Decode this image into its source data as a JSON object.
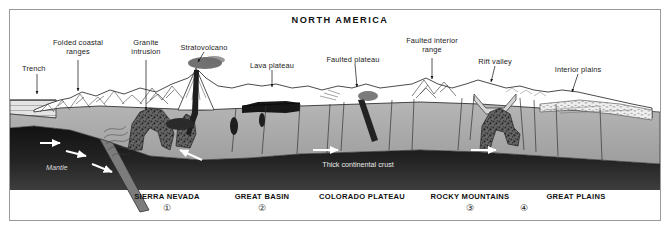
{
  "figure": {
    "title": "NORTH AMERICA",
    "frame_color": "#9a9a9a",
    "background": "#ffffff"
  },
  "callouts": [
    {
      "id": "trench",
      "text": "Trench",
      "x": 37,
      "y": 68,
      "align": "left",
      "tip_x": 37,
      "tip_y": 95
    },
    {
      "id": "folded-coastal",
      "text": "Folded coastal ranges",
      "x": 78,
      "y": 42,
      "align": "center",
      "tip_x": 78,
      "tip_y": 92
    },
    {
      "id": "granite-intrusion",
      "text": "Granite intrusion",
      "x": 146,
      "y": 42,
      "align": "center",
      "tip_x": 146,
      "tip_y": 112
    },
    {
      "id": "stratovolcano",
      "text": "Stratovolcano",
      "x": 204,
      "y": 44,
      "align": "center",
      "tip_x": 196,
      "tip_y": 70
    },
    {
      "id": "lava-plateau",
      "text": "Lava plateau",
      "x": 272,
      "y": 62,
      "align": "center",
      "tip_x": 272,
      "tip_y": 88
    },
    {
      "id": "faulted-plateau",
      "text": "Faulted plateau",
      "x": 348,
      "y": 56,
      "align": "center",
      "tip_x": 358,
      "tip_y": 88
    },
    {
      "id": "faulted-interior",
      "text": "Faulted interior range",
      "x": 432,
      "y": 40,
      "align": "center",
      "tip_x": 432,
      "tip_y": 82
    },
    {
      "id": "rift-valley",
      "text": "Rift valley",
      "x": 497,
      "y": 58,
      "align": "center",
      "tip_x": 492,
      "tip_y": 83
    },
    {
      "id": "interior-plains",
      "text": "Interior plains",
      "x": 578,
      "y": 66,
      "align": "center",
      "tip_x": 572,
      "tip_y": 93
    }
  ],
  "inner_labels": [
    {
      "id": "mantle",
      "text": "Mantle",
      "x": 46,
      "y": 168
    },
    {
      "id": "thick-crust",
      "text": "Thick continental crust",
      "x": 358,
      "y": 165
    }
  ],
  "regions": [
    {
      "id": "sierra-nevada",
      "label": "SIERRA NEVADA",
      "x": 167,
      "y": 196,
      "number": "①",
      "num_x": 167,
      "num_y": 209
    },
    {
      "id": "great-basin",
      "label": "GREAT BASIN",
      "x": 262,
      "y": 196,
      "number": "②",
      "num_x": 262,
      "num_y": 209
    },
    {
      "id": "colorado-plateau",
      "label": "COLORADO PLATEAU",
      "x": 362,
      "y": 196,
      "number": "",
      "num_x": 0,
      "num_y": 0
    },
    {
      "id": "rocky-mountains",
      "label": "ROCKY MOUNTAINS",
      "x": 470,
      "y": 196,
      "number": "③",
      "num_x": 470,
      "num_y": 209
    },
    {
      "id": "great-plains",
      "label": "GREAT PLAINS",
      "x": 576,
      "y": 196,
      "number": "",
      "num_x": 0,
      "num_y": 0
    },
    {
      "id": "unlabeled-four",
      "label": "",
      "x": 0,
      "y": 0,
      "number": "④",
      "num_x": 524,
      "num_y": 209
    }
  ],
  "palette": {
    "mantle_dark": "#1c1c1c",
    "crust_gray": "#a9a9a9",
    "crust_light": "#c7c7c7",
    "basalt_black": "#1a1a1a",
    "snow_white": "#ffffff",
    "magma_speckle": "#4a4a4a",
    "line": "#2a2a2a"
  },
  "motion_arrows": [
    {
      "id": "mantle-arrow-1",
      "x1": 40,
      "y1": 143,
      "x2": 62,
      "y2": 143
    },
    {
      "id": "mantle-arrow-2",
      "x1": 66,
      "y1": 152,
      "x2": 88,
      "y2": 156
    },
    {
      "id": "mantle-arrow-3",
      "x1": 92,
      "y1": 165,
      "x2": 114,
      "y2": 172
    },
    {
      "id": "mantle-arrow-4",
      "x1": 200,
      "y1": 158,
      "x2": 178,
      "y2": 150
    },
    {
      "id": "mantle-arrow-5",
      "x1": 313,
      "y1": 150,
      "x2": 340,
      "y2": 150
    },
    {
      "id": "mantle-arrow-6",
      "x1": 471,
      "y1": 150,
      "x2": 498,
      "y2": 150
    }
  ]
}
